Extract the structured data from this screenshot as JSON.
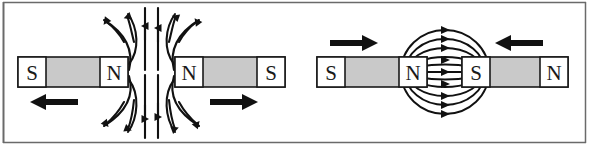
{
  "figure": {
    "width": 589,
    "height": 145,
    "background_color": "#ffffff",
    "border_color": "#4a4a4a",
    "ink_color": "#111111",
    "magnet_body_color": "#c9c9c9",
    "magnet_pole_color": "#ffffff",
    "magnet_outline_color": "#1a1a1a"
  },
  "panels": [
    {
      "id": "repulsion",
      "name": "like-poles-repel",
      "caption": "",
      "magnets": [
        {
          "id": "repulsion-left-magnet",
          "left_pole": "S",
          "right_pole": "N",
          "x": 18,
          "y": 57,
          "width": 110,
          "height": 30
        },
        {
          "id": "repulsion-right-magnet",
          "left_pole": "N",
          "right_pole": "S",
          "x": 175,
          "y": 57,
          "width": 110,
          "height": 30
        }
      ],
      "force_arrows": [
        {
          "id": "repulsion-left-force",
          "direction": "left",
          "x": 30,
          "y": 102,
          "length": 48
        },
        {
          "id": "repulsion-right-force",
          "direction": "right",
          "x": 210,
          "y": 102,
          "length": 48
        }
      ],
      "field_line_count": 8,
      "field_pattern": "lines emerge from both N poles and curve away above and below the gap"
    },
    {
      "id": "attraction",
      "name": "unlike-poles-attract",
      "caption": "",
      "magnets": [
        {
          "id": "attraction-left-magnet",
          "left_pole": "S",
          "right_pole": "N",
          "x": 317,
          "y": 57,
          "width": 110,
          "height": 30
        },
        {
          "id": "attraction-right-magnet",
          "left_pole": "S",
          "right_pole": "N",
          "x": 462,
          "y": 57,
          "width": 106,
          "height": 30
        }
      ],
      "force_arrows": [
        {
          "id": "attraction-left-force",
          "direction": "right",
          "x": 330,
          "y": 43,
          "length": 48
        },
        {
          "id": "attraction-right-force",
          "direction": "left",
          "x": 495,
          "y": 43,
          "length": 48
        }
      ],
      "field_line_count": 7,
      "field_pattern": "closed elliptical loops running from the N pole across the gap into the S pole"
    }
  ],
  "pole_labels": {
    "north": "N",
    "south": "S"
  }
}
